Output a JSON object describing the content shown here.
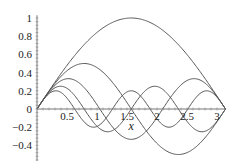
{
  "chart_data": {
    "type": "line",
    "title": "",
    "xlabel": "x",
    "ylabel": "",
    "xlim": [
      0,
      3.14159
    ],
    "ylim": [
      -0.5,
      1.0
    ],
    "grid": false,
    "legend": null,
    "x_ticks": [
      "0.5",
      "1",
      "1.5",
      "2",
      "2.5",
      "3"
    ],
    "y_ticks": [
      "1",
      "0.8",
      "0.6",
      "0.4",
      "0.2",
      "0",
      "-0.2",
      "-0.4"
    ],
    "series": [
      {
        "name": "sin(x)",
        "k": 1,
        "peak": 1.0
      },
      {
        "name": "sin(2x)/2",
        "k": 2,
        "peak": 0.5
      },
      {
        "name": "sin(3x)/3",
        "k": 3,
        "peak": 0.333
      },
      {
        "name": "sin(4x)/4",
        "k": 4,
        "peak": 0.25
      },
      {
        "name": "sin(5x)/5",
        "k": 5,
        "peak": 0.2
      }
    ],
    "line_color": "#555555"
  }
}
